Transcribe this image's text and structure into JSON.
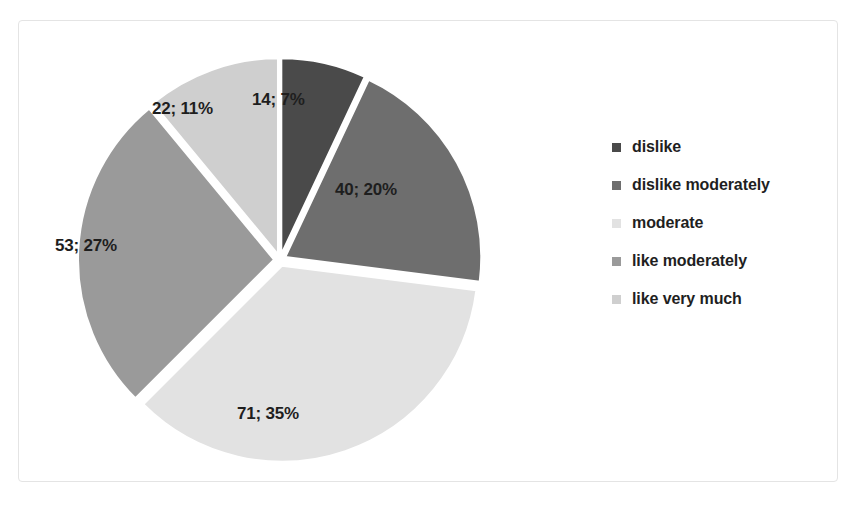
{
  "chart_data": {
    "type": "pie",
    "title": "",
    "subtitle": "",
    "xlabel": "",
    "ylabel": "",
    "legend_position": "right",
    "grid": false,
    "exploded": true,
    "start_angle_deg": 0,
    "total": 200,
    "categories": [
      "dislike",
      "dislike moderately",
      "moderate",
      "like moderately",
      "like very much"
    ],
    "values": [
      14,
      40,
      71,
      53,
      22
    ],
    "percents": [
      7,
      20,
      35,
      27,
      11
    ],
    "data_labels": [
      "14; 7%",
      "40; 20%",
      "71; 35%",
      "53; 27%",
      "22; 11%"
    ],
    "colors": [
      "#4a4a4a",
      "#6e6e6e",
      "#e2e2e2",
      "#9a9a9a",
      "#cfcfcf"
    ],
    "slices": [
      {
        "label": "dislike",
        "value": 14,
        "percent": 7,
        "data_label": "14; 7%",
        "color": "#4a4a4a"
      },
      {
        "label": "dislike moderately",
        "value": 40,
        "percent": 20,
        "data_label": "40; 20%",
        "color": "#6e6e6e"
      },
      {
        "label": "moderate",
        "value": 71,
        "percent": 35,
        "data_label": "71; 35%",
        "color": "#e2e2e2"
      },
      {
        "label": "like moderately",
        "value": 53,
        "percent": 27,
        "data_label": "53; 27%",
        "color": "#9a9a9a"
      },
      {
        "label": "like very much",
        "value": 22,
        "percent": 11,
        "data_label": "22; 11%",
        "color": "#cfcfcf"
      }
    ]
  },
  "legend": {
    "items": [
      {
        "label": "dislike",
        "color": "#4a4a4a"
      },
      {
        "label": "dislike moderately",
        "color": "#6e6e6e"
      },
      {
        "label": " moderate",
        "color": "#e2e2e2"
      },
      {
        "label": "like moderately",
        "color": "#9a9a9a"
      },
      {
        "label": "like very much",
        "color": "#cfcfcf"
      }
    ]
  },
  "frame": {
    "border_color": "#e4e4e4",
    "background": "#ffffff"
  }
}
